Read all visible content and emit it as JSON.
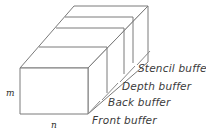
{
  "figure": {
    "geometry": {
      "projection": "oblique",
      "slab_count": 4,
      "line_color": "#7a7a7a",
      "face_color": "#ffffff",
      "text_color": "#3a3a3a"
    },
    "dimensions": [
      {
        "id": "height",
        "label": "m"
      },
      {
        "id": "width",
        "label": "n"
      }
    ],
    "buffers": [
      {
        "id": "front",
        "label": "Front buffer"
      },
      {
        "id": "back",
        "label": "Back buffer"
      },
      {
        "id": "depth",
        "label": "Depth buffer"
      },
      {
        "id": "stencil",
        "label": "Stencil buffer"
      }
    ]
  }
}
